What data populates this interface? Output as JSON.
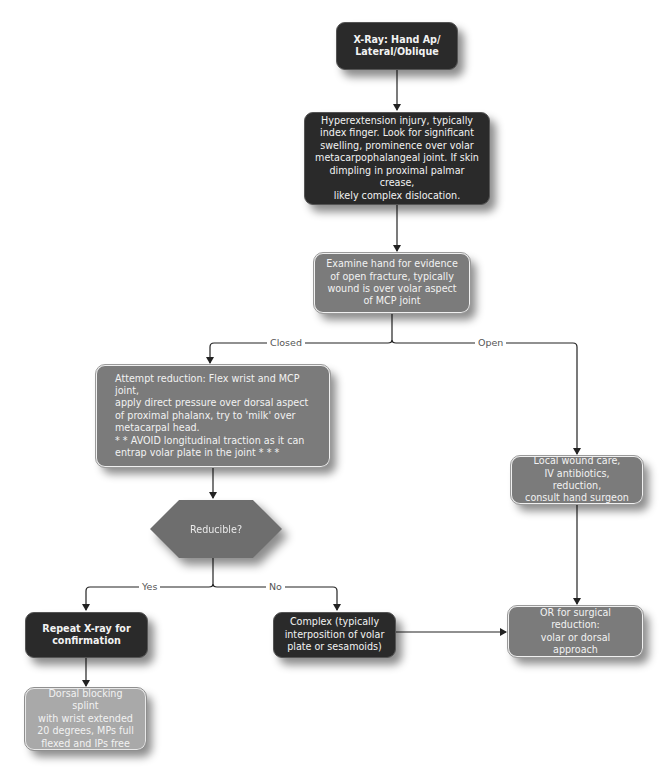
{
  "diagram": {
    "type": "flowchart",
    "colors": {
      "dark_box": "#2a2a2a",
      "mid_box": "#7b7b7b",
      "light_box": "#a9a9a9",
      "decision": "#6e6e6e",
      "connector": "#222222",
      "edge_label_text": "#555555"
    },
    "nodes": {
      "xray": {
        "text": "X-Ray: Hand Ap/\nLateral/Oblique"
      },
      "presentation": {
        "text": "Hyperextension injury, typically\nindex finger. Look for significant\nswelling, prominence over volar\nmetacarpophalangeal joint. If skin\ndimpling in proximal palmar crease,\nlikely complex dislocation."
      },
      "examine": {
        "text": "Examine hand for evidence\nof open fracture, typically\nwound is over volar aspect\nof MCP joint"
      },
      "attempt_reduction": {
        "text": "Attempt reduction: Flex wrist and MCP joint,\napply direct pressure over dorsal aspect\nof proximal phalanx, try to 'milk' over\nmetacarpal head.\n* * AVOID longitudinal traction as it can\nentrap volar plate in the joint * * *"
      },
      "local_wound_care": {
        "text": "Local wound care,\nIV antibiotics, reduction,\nconsult hand surgeon"
      },
      "reducible": {
        "text": "Reducible?"
      },
      "repeat_xray": {
        "text": "Repeat X-ray for\nconfirmation"
      },
      "complex": {
        "text": "Complex (typically\ninterposition of volar\nplate or sesamoids)"
      },
      "or_surgical": {
        "text": "OR for surgical reduction:\nvolar or dorsal approach"
      },
      "splint": {
        "text": "Dorsal blocking splint\nwith wrist extended\n20 degrees, MPs full\nflexed and IPs free"
      }
    },
    "edge_labels": {
      "closed": "Closed",
      "open": "Open",
      "yes": "Yes",
      "no": "No"
    },
    "edges": [
      {
        "from": "xray",
        "to": "presentation"
      },
      {
        "from": "presentation",
        "to": "examine"
      },
      {
        "from": "examine",
        "to": "attempt_reduction",
        "label": "Closed"
      },
      {
        "from": "examine",
        "to": "local_wound_care",
        "label": "Open"
      },
      {
        "from": "attempt_reduction",
        "to": "reducible"
      },
      {
        "from": "local_wound_care",
        "to": "or_surgical"
      },
      {
        "from": "reducible",
        "to": "repeat_xray",
        "label": "Yes"
      },
      {
        "from": "reducible",
        "to": "complex",
        "label": "No"
      },
      {
        "from": "complex",
        "to": "or_surgical"
      },
      {
        "from": "repeat_xray",
        "to": "splint"
      }
    ]
  }
}
